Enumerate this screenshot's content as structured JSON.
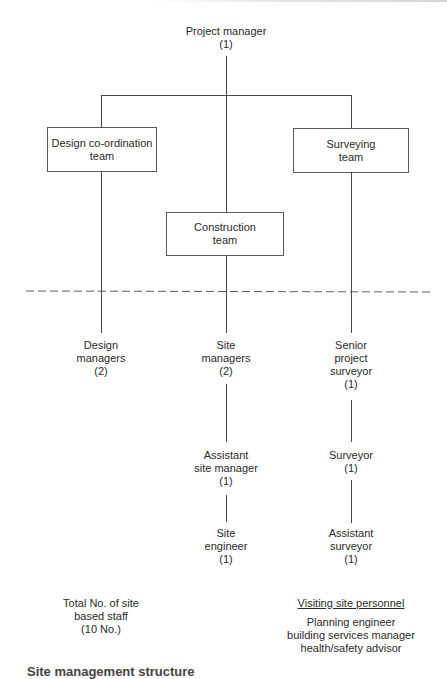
{
  "diagram": {
    "type": "org-chart",
    "top": {
      "title": "Project manager",
      "count": "(1)"
    },
    "teams": {
      "design": {
        "line1": "Design co-ordination",
        "line2": "team"
      },
      "construction": {
        "line1": "Construction",
        "line2": "team"
      },
      "surveying": {
        "line1": "Surveying",
        "line2": "team"
      }
    },
    "divider": "site boundary (dashed)",
    "site_roles": {
      "design_managers": {
        "lines": [
          "Design",
          "managers",
          "(2)"
        ]
      },
      "site_managers": {
        "lines": [
          "Site",
          "managers",
          "(2)"
        ]
      },
      "senior_project_surveyor": {
        "lines": [
          "Senior",
          "project",
          "surveyor",
          "(1)"
        ]
      },
      "assistant_site_manager": {
        "lines": [
          "Assistant",
          "site manager",
          "(1)"
        ]
      },
      "site_engineer": {
        "lines": [
          "Site",
          "engineer",
          "(1)"
        ]
      },
      "surveyor": {
        "lines": [
          "Surveyor",
          "(1)"
        ]
      },
      "assistant_surveyor": {
        "lines": [
          "Assistant",
          "surveyor",
          "(1)"
        ]
      }
    },
    "totals": {
      "lines": [
        "Total No. of site",
        "based staff",
        "(10 No.)"
      ]
    },
    "visiting": {
      "title": "Visiting site personnel",
      "items": [
        "Planning engineer",
        "building services manager",
        "health/safety advisor"
      ]
    },
    "caption": "Site management structure"
  }
}
